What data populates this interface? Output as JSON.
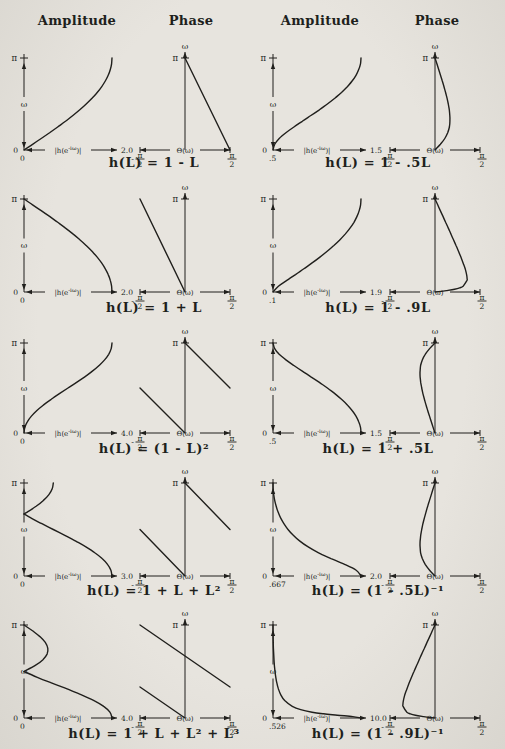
{
  "page": {
    "paper_color": "#e7e4de",
    "ink_color": "#201f1c"
  },
  "headers": [
    "Amplitude",
    "Phase",
    "Amplitude",
    "Phase"
  ],
  "axis_text": {
    "amp_label_pre": "|h(e",
    "amp_label_sup": "-iω",
    "amp_label_post": ")|",
    "phase_label": "Θ(ω)",
    "omega": "ω",
    "pi": "π",
    "zero": "0",
    "half_pi_num": "π",
    "half_pi_den": "2",
    "minus": "-"
  },
  "chart_data": [
    {
      "type": "line",
      "caption": "h(L) = 1 - L",
      "ylabel": "ω",
      "ylim": [
        "0",
        "π"
      ],
      "amplitude": {
        "xlabel": "|h(e^-iω)|",
        "xmin": 0,
        "xmax": 2,
        "xmin_label": "0",
        "xmax_label": "2.0",
        "curves": [
          {
            "omega_over_pi": [
              0,
              0.0625,
              0.125,
              0.1875,
              0.25,
              0.3125,
              0.375,
              0.4375,
              0.5,
              0.5625,
              0.625,
              0.6875,
              0.75,
              0.8125,
              0.875,
              0.9375,
              1
            ],
            "values": [
              0,
              0.196,
              0.39,
              0.581,
              0.765,
              0.943,
              1.111,
              1.269,
              1.414,
              1.546,
              1.663,
              1.764,
              1.848,
              1.914,
              1.962,
              1.99,
              2
            ]
          }
        ]
      },
      "phase": {
        "xlabel": "Θ(ω)",
        "xlim": [
          "-π/2",
          "π/2"
        ],
        "curves": [
          {
            "theta_over_halfpi": [
              1,
              0
            ],
            "omega_over_pi": [
              0,
              1
            ]
          }
        ]
      }
    },
    {
      "type": "line",
      "caption": "h(L) = 1 - .5L",
      "ylabel": "ω",
      "ylim": [
        "0",
        "π"
      ],
      "amplitude": {
        "xlabel": "|h(e^-iω)|",
        "xmin": 0.5,
        "xmax": 1.5,
        "xmin_label": ".5",
        "xmax_label": "1.5",
        "curves": [
          {
            "omega_over_pi": [
              0,
              0.0625,
              0.125,
              0.1875,
              0.25,
              0.3125,
              0.375,
              0.4375,
              0.5,
              0.5625,
              0.625,
              0.6875,
              0.75,
              0.8125,
              0.875,
              0.9375,
              1
            ],
            "values": [
              0.5,
              0.519,
              0.571,
              0.647,
              0.737,
              0.833,
              0.931,
              1.027,
              1.118,
              1.202,
              1.278,
              1.344,
              1.399,
              1.443,
              1.474,
              1.494,
              1.5
            ]
          }
        ]
      },
      "phase": {
        "xlabel": "Θ(ω)",
        "xlim": [
          "-π/2",
          "π/2"
        ],
        "curves": [
          {
            "theta_over_halfpi": [
              0,
              0.12,
              0.218,
              0.282,
              0.319,
              0.332,
              0.33,
              0.317,
              0.295,
              0.268,
              0.235,
              0.2,
              0.163,
              0.123,
              0.083,
              0.042,
              0
            ],
            "omega_over_pi": [
              0,
              0.0625,
              0.125,
              0.1875,
              0.25,
              0.3125,
              0.375,
              0.4375,
              0.5,
              0.5625,
              0.625,
              0.6875,
              0.75,
              0.8125,
              0.875,
              0.9375,
              1
            ]
          }
        ]
      }
    },
    {
      "type": "line",
      "caption": "h(L) = 1 + L",
      "ylabel": "ω",
      "ylim": [
        "0",
        "π"
      ],
      "amplitude": {
        "xlabel": "|h(e^-iω)|",
        "xmin": 0,
        "xmax": 2,
        "xmin_label": "0",
        "xmax_label": "2.0",
        "curves": [
          {
            "omega_over_pi": [
              0,
              0.0625,
              0.125,
              0.1875,
              0.25,
              0.3125,
              0.375,
              0.4375,
              0.5,
              0.5625,
              0.625,
              0.6875,
              0.75,
              0.8125,
              0.875,
              0.9375,
              1
            ],
            "values": [
              2,
              1.99,
              1.962,
              1.914,
              1.848,
              1.764,
              1.663,
              1.546,
              1.414,
              1.269,
              1.111,
              0.943,
              0.765,
              0.581,
              0.39,
              0.196,
              0
            ]
          }
        ]
      },
      "phase": {
        "xlabel": "Θ(ω)",
        "xlim": [
          "-π/2",
          "π/2"
        ],
        "curves": [
          {
            "theta_over_halfpi": [
              0,
              -1
            ],
            "omega_over_pi": [
              0,
              1
            ]
          }
        ]
      }
    },
    {
      "type": "line",
      "caption": "h(L) = 1 - .9L",
      "ylabel": "ω",
      "ylim": [
        "0",
        "π"
      ],
      "amplitude": {
        "xlabel": "|h(e^-iω)|",
        "xmin": 0.1,
        "xmax": 1.9,
        "xmin_label": ".1",
        "xmax_label": "1.9",
        "curves": [
          {
            "omega_over_pi": [
              0,
              0.0625,
              0.125,
              0.1875,
              0.25,
              0.3125,
              0.375,
              0.4375,
              0.5,
              0.5625,
              0.625,
              0.6875,
              0.75,
              0.8125,
              0.875,
              0.9375,
              1
            ],
            "values": [
              0.1,
              0.211,
              0.383,
              0.56,
              0.733,
              0.9,
              1.059,
              1.208,
              1.345,
              1.47,
              1.581,
              1.676,
              1.756,
              1.818,
              1.864,
              1.891,
              1.9
            ]
          }
        ]
      },
      "phase": {
        "xlabel": "Θ(ω)",
        "xlim": [
          "-π/2",
          "π/2"
        ],
        "curves": [
          {
            "theta_over_halfpi": [
              0,
              0.253,
              0.435,
              0.548,
              0.625,
              0.71,
              0.713,
              0.703,
              0.67,
              0.625,
              0.575,
              0.522,
              0.467,
              0.41,
              0.353,
              0.295,
              0.236,
              0.177,
              0.118,
              0.059,
              0
            ],
            "omega_over_pi": [
              0,
              0.015,
              0.03,
              0.045,
              0.0625,
              0.125,
              0.144,
              0.1875,
              0.25,
              0.3125,
              0.375,
              0.4375,
              0.5,
              0.5625,
              0.625,
              0.6875,
              0.75,
              0.8125,
              0.875,
              0.9375,
              1
            ]
          }
        ]
      }
    },
    {
      "type": "line",
      "caption": "h(L) = (1 - L)²",
      "ylabel": "ω",
      "ylim": [
        "0",
        "π"
      ],
      "amplitude": {
        "xlabel": "|h(e^-iω)|",
        "xmin": 0,
        "xmax": 4,
        "xmin_label": "0",
        "xmax_label": "4.0",
        "curves": [
          {
            "omega_over_pi": [
              0,
              0.0625,
              0.125,
              0.1875,
              0.25,
              0.3125,
              0.375,
              0.4375,
              0.5,
              0.5625,
              0.625,
              0.6875,
              0.75,
              0.8125,
              0.875,
              0.9375,
              1
            ],
            "values": [
              0,
              0.038,
              0.152,
              0.337,
              0.586,
              0.889,
              1.235,
              1.61,
              2,
              2.39,
              2.765,
              3.111,
              3.414,
              3.663,
              3.848,
              3.962,
              4
            ]
          }
        ]
      },
      "phase": {
        "xlabel": "Θ(ω)",
        "xlim": [
          "-π/2",
          "π/2"
        ],
        "curves": [
          {
            "theta_over_halfpi": [
              0,
              -1
            ],
            "omega_over_pi": [
              0,
              0.5
            ]
          },
          {
            "theta_over_halfpi": [
              1,
              0
            ],
            "omega_over_pi": [
              0.5,
              1
            ]
          }
        ]
      }
    },
    {
      "type": "line",
      "caption": "h(L) = 1 + .5L",
      "ylabel": "ω",
      "ylim": [
        "0",
        "π"
      ],
      "amplitude": {
        "xlabel": "|h(e^-iω)|",
        "xmin": 0.5,
        "xmax": 1.5,
        "xmin_label": ".5",
        "xmax_label": "1.5",
        "curves": [
          {
            "omega_over_pi": [
              0,
              0.0625,
              0.125,
              0.1875,
              0.25,
              0.3125,
              0.375,
              0.4375,
              0.5,
              0.5625,
              0.625,
              0.6875,
              0.75,
              0.8125,
              0.875,
              0.9375,
              1
            ],
            "values": [
              1.5,
              1.494,
              1.474,
              1.443,
              1.399,
              1.344,
              1.278,
              1.202,
              1.118,
              1.027,
              0.931,
              0.833,
              0.737,
              0.647,
              0.571,
              0.519,
              0.5
            ]
          }
        ]
      },
      "phase": {
        "xlabel": "Θ(ω)",
        "xlim": [
          "-π/2",
          "π/2"
        ],
        "curves": [
          {
            "theta_over_halfpi": [
              0,
              -0.042,
              -0.083,
              -0.123,
              -0.163,
              -0.2,
              -0.235,
              -0.268,
              -0.295,
              -0.317,
              -0.33,
              -0.333,
              -0.332,
              -0.319,
              -0.282,
              -0.218,
              -0.12,
              0
            ],
            "omega_over_pi": [
              0,
              0.0625,
              0.125,
              0.1875,
              0.25,
              0.3125,
              0.375,
              0.4375,
              0.5,
              0.5625,
              0.625,
              0.6667,
              0.6875,
              0.75,
              0.8125,
              0.875,
              0.9375,
              1
            ]
          }
        ]
      }
    },
    {
      "type": "line",
      "caption": "h(L) = 1 + L + L²",
      "ylabel": "ω",
      "ylim": [
        "0",
        "π"
      ],
      "amplitude": {
        "xlabel": "|h(e^-iω)|",
        "xmin": 0,
        "xmax": 3,
        "xmin_label": "0",
        "xmax_label": "3.0",
        "curves": [
          {
            "omega_over_pi": [
              0,
              0.0625,
              0.125,
              0.1875,
              0.25,
              0.3125,
              0.375,
              0.4375,
              0.5,
              0.5625,
              0.625,
              0.6667
            ],
            "values": [
              3,
              2.962,
              2.848,
              2.663,
              2.414,
              2.111,
              1.765,
              1.39,
              1,
              0.61,
              0.235,
              0
            ]
          },
          {
            "omega_over_pi": [
              0.6667,
              0.6875,
              0.75,
              0.8125,
              0.875,
              0.9375,
              1
            ],
            "values": [
              0,
              0.111,
              0.414,
              0.663,
              0.848,
              0.962,
              1
            ]
          }
        ]
      },
      "phase": {
        "xlabel": "Θ(ω)",
        "xlim": [
          "-π/2",
          "π/2"
        ],
        "curves": [
          {
            "theta_over_halfpi": [
              0,
              -1
            ],
            "omega_over_pi": [
              0,
              0.5
            ]
          },
          {
            "theta_over_halfpi": [
              1,
              0
            ],
            "omega_over_pi": [
              0.5,
              1
            ]
          }
        ]
      }
    },
    {
      "type": "line",
      "caption": "h(L) = (1 - .5L)⁻¹",
      "ylabel": "ω",
      "ylim": [
        "0",
        "π"
      ],
      "amplitude": {
        "xlabel": "|h(e^-iω)|",
        "xmin": 0.667,
        "xmax": 2,
        "xmin_label": ".667",
        "xmax_label": "2.0",
        "curves": [
          {
            "omega_over_pi": [
              0,
              0.0625,
              0.125,
              0.1875,
              0.25,
              0.3125,
              0.375,
              0.4375,
              0.5,
              0.5625,
              0.625,
              0.6875,
              0.75,
              0.8125,
              0.875,
              0.9375,
              1
            ],
            "values": [
              2,
              1.927,
              1.751,
              1.546,
              1.357,
              1.2,
              1.074,
              0.974,
              0.894,
              0.832,
              0.782,
              0.744,
              0.715,
              0.693,
              0.678,
              0.669,
              0.667
            ]
          }
        ]
      },
      "phase": {
        "xlabel": "Θ(ω)",
        "xlim": [
          "-π/2",
          "π/2"
        ],
        "curves": [
          {
            "theta_over_halfpi": [
              0,
              -0.12,
              -0.218,
              -0.282,
              -0.319,
              -0.332,
              -0.333,
              -0.33,
              -0.317,
              -0.295,
              -0.268,
              -0.235,
              -0.2,
              -0.163,
              -0.123,
              -0.083,
              -0.042,
              0
            ],
            "omega_over_pi": [
              0,
              0.0625,
              0.125,
              0.1875,
              0.25,
              0.3125,
              0.3333,
              0.375,
              0.4375,
              0.5,
              0.5625,
              0.625,
              0.6875,
              0.75,
              0.8125,
              0.875,
              0.9375,
              1
            ]
          }
        ]
      }
    },
    {
      "type": "line",
      "caption": "h(L) = 1 + L + L² + L³",
      "ylabel": "ω",
      "ylim": [
        "0",
        "π"
      ],
      "amplitude": {
        "xlabel": "|h(e^-iω)|",
        "xmin": 0,
        "xmax": 4,
        "xmin_label": "0",
        "xmax_label": "4.0",
        "curves": [
          {
            "omega_over_pi": [
              0,
              0.0625,
              0.125,
              0.1875,
              0.25,
              0.3125,
              0.375,
              0.4375,
              0.5
            ],
            "values": [
              4,
              3.905,
              3.624,
              3.183,
              2.613,
              1.96,
              1.273,
              0.603,
              0
            ]
          },
          {
            "omega_over_pi": [
              0.5,
              0.5625,
              0.625,
              0.6875,
              0.75,
              0.8125,
              0.875,
              0.9375,
              1
            ],
            "values": [
              0,
              0.495,
              0.85,
              1.048,
              1.082,
              0.966,
              0.721,
              0.385,
              0
            ]
          }
        ]
      },
      "phase": {
        "xlabel": "Θ(ω)",
        "xlim": [
          "-π/2",
          "π/2"
        ],
        "curves": [
          {
            "theta_over_halfpi": [
              0,
              -1
            ],
            "omega_over_pi": [
              0,
              0.3333
            ]
          },
          {
            "theta_over_halfpi": [
              1,
              -1
            ],
            "omega_over_pi": [
              0.3333,
              1
            ]
          }
        ]
      }
    },
    {
      "type": "line",
      "caption": "h(L) = (1 - .9L)⁻¹",
      "ylabel": "ω",
      "ylim": [
        "0",
        "π"
      ],
      "amplitude": {
        "xlabel": "|h(e^-iω)|",
        "xmin": 0.526,
        "xmax": 10,
        "xmin_label": ".526",
        "xmax_label": "10.0",
        "curves": [
          {
            "omega_over_pi": [
              0,
              0.015,
              0.03,
              0.045,
              0.0625,
              0.09,
              0.125,
              0.1875,
              0.25,
              0.3125,
              0.375,
              0.4375,
              0.5,
              0.5625,
              0.625,
              0.6875,
              0.75,
              0.8125,
              0.875,
              0.9375,
              1
            ],
            "values": [
              10,
              9.12,
              7.45,
              5.97,
              4.735,
              3.505,
              2.608,
              1.787,
              1.364,
              1.111,
              0.944,
              0.828,
              0.743,
              0.68,
              0.633,
              0.597,
              0.569,
              0.55,
              0.537,
              0.529,
              0.526
            ]
          }
        ]
      },
      "phase": {
        "xlabel": "Θ(ω)",
        "xlim": [
          "-π/2",
          "π/2"
        ],
        "curves": [
          {
            "theta_over_halfpi": [
              0,
              -0.253,
              -0.435,
              -0.548,
              -0.625,
              -0.71,
              -0.713,
              -0.703,
              -0.67,
              -0.625,
              -0.575,
              -0.522,
              -0.467,
              -0.41,
              -0.353,
              -0.295,
              -0.236,
              -0.177,
              -0.118,
              -0.059,
              0
            ],
            "omega_over_pi": [
              0,
              0.015,
              0.03,
              0.045,
              0.0625,
              0.125,
              0.144,
              0.1875,
              0.25,
              0.3125,
              0.375,
              0.4375,
              0.5,
              0.5625,
              0.625,
              0.6875,
              0.75,
              0.8125,
              0.875,
              0.9375,
              1
            ]
          }
        ]
      }
    }
  ]
}
